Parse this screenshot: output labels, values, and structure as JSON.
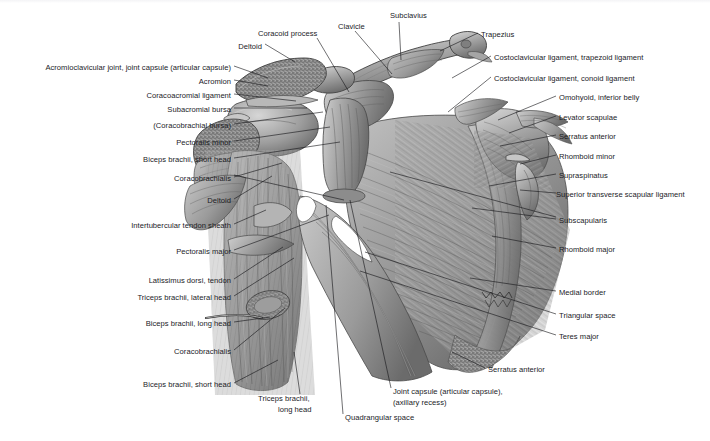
{
  "figure": {
    "style": "grayscale anatomical illustration",
    "background_color": "#ffffff",
    "line_color": "#16161a",
    "text_color": "#1b1b1f"
  },
  "labels": {
    "left": [
      {
        "text": "Acromioclavicular joint, joint capsule (articular capsule)",
        "x": 231,
        "y": 68,
        "anchor": "right"
      },
      {
        "text": "Acromion",
        "x": 231,
        "y": 82,
        "anchor": "right"
      },
      {
        "text": "Coracoacromial ligament",
        "x": 231,
        "y": 96,
        "anchor": "right"
      },
      {
        "text": "Subacromial bursa",
        "x": 231,
        "y": 110,
        "anchor": "right"
      },
      {
        "text": "(Coracobrachial bursa)",
        "x": 231,
        "y": 126,
        "anchor": "right"
      },
      {
        "text": "Pectoralis minor",
        "x": 231,
        "y": 143,
        "anchor": "right"
      },
      {
        "text": "Biceps brachii, short head",
        "x": 231,
        "y": 160,
        "anchor": "right"
      },
      {
        "text": "Coracobrachialis",
        "x": 231,
        "y": 179,
        "anchor": "right"
      },
      {
        "text": "Deltoid",
        "x": 231,
        "y": 201,
        "anchor": "right"
      },
      {
        "text": "Intertubercular tendon sheath",
        "x": 231,
        "y": 226,
        "anchor": "right"
      },
      {
        "text": "Pectoralis major",
        "x": 231,
        "y": 252,
        "anchor": "right"
      },
      {
        "text": "Latissimus dorsi, tendon",
        "x": 231,
        "y": 281,
        "anchor": "right"
      },
      {
        "text": "Triceps brachii, lateral head",
        "x": 231,
        "y": 298,
        "anchor": "right"
      },
      {
        "text": "Biceps brachii, long head",
        "x": 231,
        "y": 324,
        "anchor": "right"
      },
      {
        "text": "Coracobrachialis",
        "x": 231,
        "y": 352,
        "anchor": "right"
      },
      {
        "text": "Biceps brachii, short head",
        "x": 231,
        "y": 385,
        "anchor": "right"
      }
    ],
    "top": [
      {
        "text": "Deltoid",
        "x": 262,
        "y": 47,
        "anchor": "right"
      },
      {
        "text": "Coracoid process",
        "x": 258,
        "y": 34,
        "anchor": "left"
      },
      {
        "text": "Clavicle",
        "x": 338,
        "y": 27,
        "anchor": "left"
      },
      {
        "text": "Subclavius",
        "x": 390,
        "y": 16,
        "anchor": "left"
      },
      {
        "text": "Trapezius",
        "x": 481,
        "y": 35,
        "anchor": "left"
      }
    ],
    "right": [
      {
        "text": "Costoclavicular ligament, trapezoid ligament",
        "x": 494,
        "y": 58,
        "anchor": "left"
      },
      {
        "text": "Costoclavicular ligament, conoid ligament",
        "x": 494,
        "y": 79,
        "anchor": "left"
      },
      {
        "text": "Omohyoid, inferior belly",
        "x": 559,
        "y": 98,
        "anchor": "left"
      },
      {
        "text": "Levator scapulae",
        "x": 559,
        "y": 118,
        "anchor": "left"
      },
      {
        "text": "Serratus anterior",
        "x": 559,
        "y": 137,
        "anchor": "left"
      },
      {
        "text": "Rhomboid minor",
        "x": 559,
        "y": 157,
        "anchor": "left"
      },
      {
        "text": "Supraspinatus",
        "x": 559,
        "y": 176,
        "anchor": "left"
      },
      {
        "text": "Superior transverse scapular ligament",
        "x": 559,
        "y": 195,
        "anchor": "left"
      },
      {
        "text": "Subscapularis",
        "x": 559,
        "y": 221,
        "anchor": "left"
      },
      {
        "text": "Rhomboid major",
        "x": 559,
        "y": 250,
        "anchor": "left"
      },
      {
        "text": "Medial border",
        "x": 559,
        "y": 293,
        "anchor": "left"
      },
      {
        "text": "Triangular space",
        "x": 559,
        "y": 316,
        "anchor": "left"
      },
      {
        "text": "Teres major",
        "x": 559,
        "y": 337,
        "anchor": "left"
      },
      {
        "text": "Serratus anterior",
        "x": 488,
        "y": 370,
        "anchor": "left"
      }
    ],
    "bottom": [
      {
        "text": "Triceps brachii,",
        "x": 258,
        "y": 399,
        "anchor": "left"
      },
      {
        "text": "long head",
        "x": 278,
        "y": 410,
        "anchor": "left"
      },
      {
        "text": "Quadrangular space",
        "x": 345,
        "y": 418,
        "anchor": "left"
      },
      {
        "text": "Joint capsule (articular capsule),",
        "x": 393,
        "y": 392,
        "anchor": "left"
      },
      {
        "text": "(axillary recess)",
        "x": 393,
        "y": 403,
        "anchor": "left"
      }
    ]
  }
}
